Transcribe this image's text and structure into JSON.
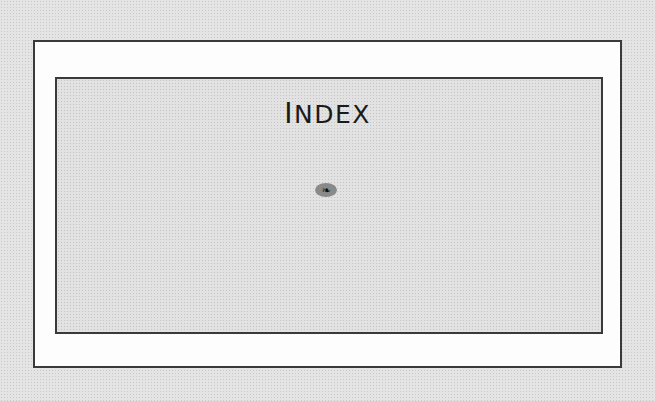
{
  "page": {
    "title": "INDEX",
    "title_first_letter": "I",
    "title_rest": "NDEX",
    "ornament": {
      "icon": "fleuron-ornament-icon",
      "glyph": "❧"
    }
  }
}
